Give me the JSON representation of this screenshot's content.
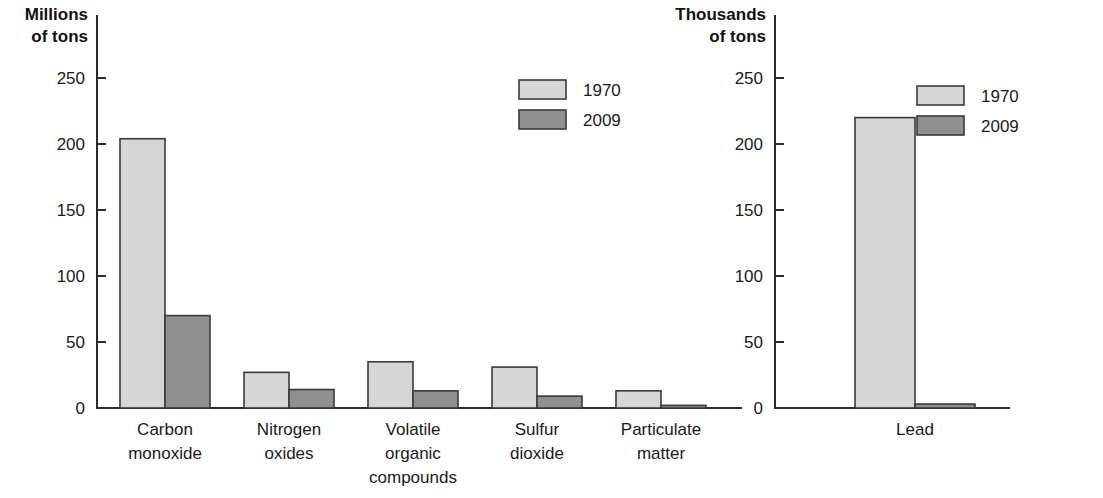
{
  "chart_data": [
    {
      "id": "air-pollutant-emissions",
      "type": "bar",
      "title": "",
      "ylabel": "Millions of tons",
      "ylabel_lines": [
        "Millions",
        "of tons"
      ],
      "xlabel": "",
      "ylim": [
        0,
        250
      ],
      "yticks": [
        0,
        50,
        100,
        150,
        200,
        250
      ],
      "ytick_labels": [
        "0",
        "50",
        "100",
        "150",
        "200",
        "250"
      ],
      "grid": false,
      "legend_position": "top-right",
      "categories": [
        "Carbon monoxide",
        "Nitrogen oxides",
        "Volatile organic compounds",
        "Sulfur dioxide",
        "Particulate matter"
      ],
      "category_label_lines": [
        [
          "Carbon",
          "monoxide"
        ],
        [
          "Nitrogen",
          "oxides"
        ],
        [
          "Volatile",
          "organic",
          "compounds"
        ],
        [
          "Sulfur",
          "dioxide"
        ],
        [
          "Particulate",
          "matter"
        ]
      ],
      "series": [
        {
          "name": "1970",
          "color": "#d6d6d6",
          "values": [
            204,
            27,
            35,
            31,
            13
          ]
        },
        {
          "name": "2009",
          "color": "#8f8f8f",
          "values": [
            70,
            14,
            13,
            9,
            2
          ]
        }
      ]
    },
    {
      "id": "lead-emissions",
      "type": "bar",
      "title": "",
      "ylabel": "Thousands of tons",
      "ylabel_lines": [
        "Thousands",
        "of tons"
      ],
      "xlabel": "",
      "ylim": [
        0,
        250
      ],
      "yticks": [
        0,
        50,
        100,
        150,
        200,
        250
      ],
      "ytick_labels": [
        "0",
        "50",
        "100",
        "150",
        "200",
        "250"
      ],
      "grid": false,
      "legend_position": "top-right",
      "categories": [
        "Lead"
      ],
      "category_label_lines": [
        [
          "Lead"
        ]
      ],
      "series": [
        {
          "name": "1970",
          "color": "#d6d6d6",
          "values": [
            220
          ]
        },
        {
          "name": "2009",
          "color": "#8f8f8f",
          "values": [
            3
          ]
        }
      ]
    }
  ],
  "legend": {
    "entries": [
      {
        "label": "1970",
        "color": "#d6d6d6"
      },
      {
        "label": "2009",
        "color": "#8f8f8f"
      }
    ]
  },
  "colors": {
    "series_1970": "#d6d6d6",
    "series_2009": "#8f8f8f",
    "axis": "#2b2b2b",
    "bar_outline": "#3a3a3a",
    "text": "#1a1a1a",
    "background": "#ffffff"
  }
}
